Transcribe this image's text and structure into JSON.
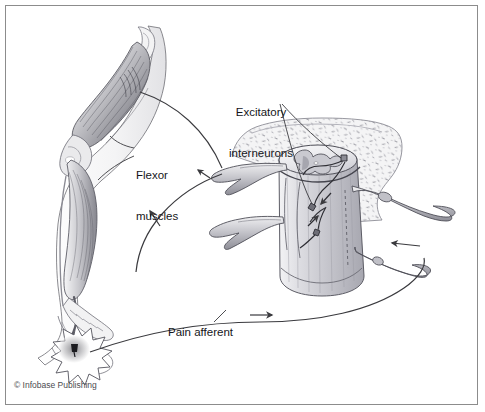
{
  "figure": {
    "background_color": "#ffffff",
    "border_color": "#8c8c8c",
    "text_color": "#15161a"
  },
  "labels": {
    "excitatory_interneurons": "Excitatory\ninterneurons",
    "excitatory_interneurons_line1": "Excitatory",
    "excitatory_interneurons_line2": "interneurons",
    "flexor_muscles": "Flexor\nmuscles",
    "flexor_muscles_line1": "Flexor",
    "flexor_muscles_line2": "muscles",
    "pain_afferent": "Pain afferent"
  },
  "credit": {
    "text": "© Infobase Publishing"
  },
  "anatomy": {
    "leg": {
      "name": "flexed-leg",
      "description": "Side view of a flexed human leg with thigh flexor musculature, knee, lower leg and foot"
    },
    "spinal_cord": {
      "name": "spinal-cord-segment",
      "description": "Cut cylindrical spinal cord segment with butterfly gray matter, surrounded by vertebral bone"
    },
    "vertebra": {
      "name": "vertebral-bone",
      "description": "Stippled cancellous vertebral bone behind the cord"
    },
    "nerve_roots": [
      "dorsal-root-upper-left",
      "ventral-root-lower-left",
      "dorsal-root-upper-right",
      "ventral-root-lower-right"
    ],
    "pain_stimulus": {
      "name": "pain-stimulus-burst",
      "description": "Starburst at the sole of the foot marking a noxious tack stimulus"
    }
  },
  "pathways": [
    {
      "name": "pain-afferent-pathway",
      "label": "Pain afferent",
      "direction": "foot-to-spinal-cord",
      "arrow": "right"
    },
    {
      "name": "motor-efferent-pathway",
      "label": "",
      "direction": "spinal-cord-to-flexor-muscles",
      "arrow": "up-left"
    },
    {
      "name": "dorsal-root-entry-arrow",
      "label": "",
      "direction": "into-cord",
      "arrow": "left"
    }
  ],
  "colors": {
    "ink": "#3a3a3e",
    "line": "#4a4a4e",
    "muscle_light": "#e8e8ea",
    "muscle_mid": "#b9b9be",
    "muscle_dark": "#7e7e85",
    "bone_fill": "#f0f0f0",
    "cord_fill": "#dcdce0",
    "gray_matter": "#cfcfd4",
    "nerve_fill": "#c4c4ca"
  }
}
